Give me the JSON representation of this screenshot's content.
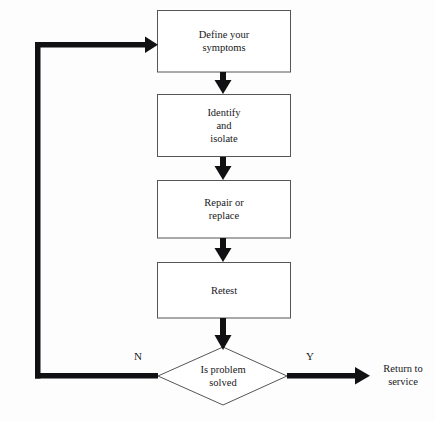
{
  "diagram": {
    "stroke_color": "#55555a",
    "arrow_color": "#111114",
    "background": "#fdfdfd",
    "nodes": [
      {
        "id": "define",
        "shape": "process",
        "text": "Define your\nsymptoms"
      },
      {
        "id": "identify",
        "shape": "process",
        "text": "Identify\nand\nisolate"
      },
      {
        "id": "repair",
        "shape": "process",
        "text": "Repair or\nreplace"
      },
      {
        "id": "retest",
        "shape": "process",
        "text": "Retest"
      },
      {
        "id": "decision",
        "shape": "decision",
        "text": "Is problem\nsolved"
      },
      {
        "id": "return",
        "shape": "terminal",
        "text": "Return to\nservice"
      }
    ],
    "edges": [
      {
        "from": "define",
        "to": "identify",
        "label": ""
      },
      {
        "from": "identify",
        "to": "repair",
        "label": ""
      },
      {
        "from": "repair",
        "to": "retest",
        "label": ""
      },
      {
        "from": "retest",
        "to": "decision",
        "label": ""
      },
      {
        "from": "decision",
        "to": "define",
        "label": "N"
      },
      {
        "from": "decision",
        "to": "return",
        "label": "Y"
      }
    ],
    "labels": {
      "no_branch": "N",
      "yes_branch": "Y"
    }
  }
}
